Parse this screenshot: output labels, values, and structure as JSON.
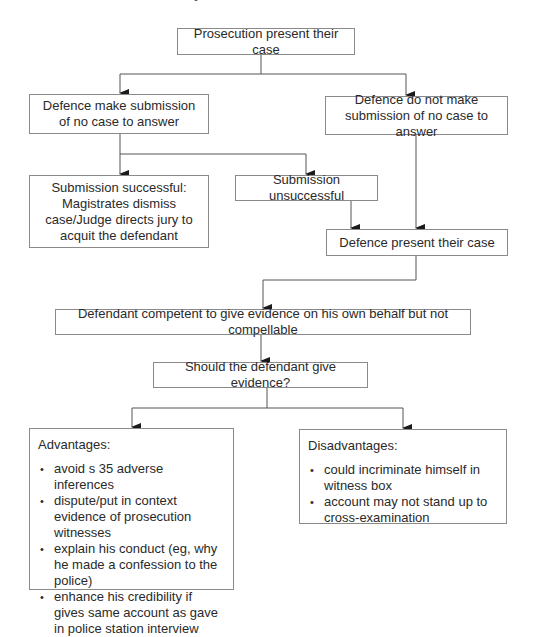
{
  "diagram": {
    "type": "flowchart",
    "title_fragment_visible": true,
    "nodes": {
      "prosecution": {
        "label": "Prosecution present their case"
      },
      "defence_submission": {
        "label": "Defence make submission of no case to answer"
      },
      "defence_no_submission": {
        "label": "Defence do not make submission of no case to answer"
      },
      "submission_successful": {
        "label": "Submission successful: Magistrates dismiss case/Judge directs jury to acquit the defendant"
      },
      "submission_unsuccessful": {
        "label": "Submission unsuccessful"
      },
      "defence_present": {
        "label": "Defence present their case"
      },
      "defendant_competent": {
        "label": "Defendant competent to give evidence on his own behalf but not compellable"
      },
      "should_give_evidence": {
        "label": "Should the defendant give evidence?"
      },
      "advantages": {
        "heading": "Advantages:",
        "items": [
          "avoid s 35 adverse inferences",
          "dispute/put in context evidence of prosecution witnesses",
          "explain his conduct (eg, why he made a confession to the police)",
          "enhance his credibility if gives same account as gave in police station interview"
        ]
      },
      "disadvantages": {
        "heading": "Disadvantages:",
        "items": [
          "could incriminate himself in witness box",
          "account may not stand up to cross-examination"
        ]
      }
    },
    "edges": [
      [
        "prosecution",
        "defence_submission"
      ],
      [
        "prosecution",
        "defence_no_submission"
      ],
      [
        "defence_submission",
        "submission_successful"
      ],
      [
        "defence_submission",
        "submission_unsuccessful"
      ],
      [
        "submission_unsuccessful",
        "defence_present"
      ],
      [
        "defence_no_submission",
        "defence_present"
      ],
      [
        "defence_present",
        "defendant_competent"
      ],
      [
        "defendant_competent",
        "should_give_evidence"
      ],
      [
        "should_give_evidence",
        "advantages"
      ],
      [
        "should_give_evidence",
        "disadvantages"
      ]
    ],
    "colors": {
      "line": "#555555",
      "border": "#8a8a8a",
      "text": "#2a2a2a"
    }
  }
}
